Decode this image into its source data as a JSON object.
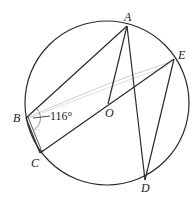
{
  "diagram": {
    "type": "circle-geometry",
    "circle": {
      "cx": 107,
      "cy": 103,
      "r": 82
    },
    "points": {
      "A": {
        "x": 127,
        "y": 26,
        "label": "A"
      },
      "E": {
        "x": 174,
        "y": 59,
        "label": "E"
      },
      "B": {
        "x": 26,
        "y": 118,
        "label": "B"
      },
      "C": {
        "x": 40,
        "y": 153,
        "label": "C"
      },
      "D": {
        "x": 145,
        "y": 180,
        "label": "D"
      },
      "O": {
        "x": 108,
        "y": 104,
        "label": "O"
      }
    },
    "segments": [
      "AB",
      "AO",
      "AD",
      "ED",
      "EC",
      "BC"
    ],
    "angle_label": "116°",
    "stroke_color": "#2a2a2a"
  }
}
